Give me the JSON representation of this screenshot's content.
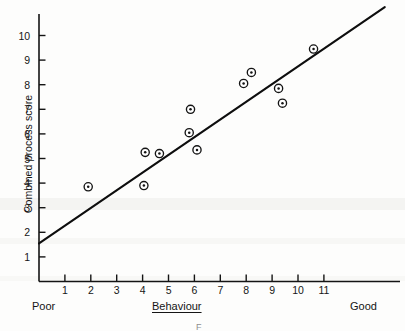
{
  "figure": {
    "name": "scatter-with-regression-line"
  },
  "chart_data": {
    "type": "scatter",
    "title": "",
    "xlabel": "Behaviour",
    "ylabel": "Combined process score",
    "xlim": [
      0,
      13.7
    ],
    "ylim": [
      0,
      11.3
    ],
    "grid": false,
    "legend": null,
    "x_tick_labels": [
      "1",
      "2",
      "3",
      "4",
      "5",
      "6",
      "7",
      "8",
      "9",
      "10",
      "11"
    ],
    "x_ticks": [
      1,
      2,
      3,
      4,
      5,
      6,
      7,
      8,
      9,
      10,
      11
    ],
    "y_tick_labels": [
      "1",
      "2",
      "3",
      "4",
      "5",
      "6",
      "7",
      "8",
      "9",
      "10"
    ],
    "y_ticks": [
      1,
      2,
      3,
      4,
      5,
      6,
      7,
      8,
      9,
      10
    ],
    "x_axis_low_anchor": "Poor",
    "x_axis_high_anchor": "Good",
    "points": [
      {
        "x": 1.9,
        "y": 3.85
      },
      {
        "x": 4.05,
        "y": 3.9
      },
      {
        "x": 4.1,
        "y": 5.25
      },
      {
        "x": 4.65,
        "y": 5.2
      },
      {
        "x": 5.8,
        "y": 6.05
      },
      {
        "x": 5.85,
        "y": 7.0
      },
      {
        "x": 6.1,
        "y": 5.35
      },
      {
        "x": 7.9,
        "y": 8.05
      },
      {
        "x": 8.2,
        "y": 8.5
      },
      {
        "x": 9.25,
        "y": 7.85
      },
      {
        "x": 9.4,
        "y": 7.25
      },
      {
        "x": 10.6,
        "y": 9.45
      }
    ],
    "marker_style": "circle-with-center-dot",
    "fit_line": {
      "type": "linear-regression",
      "x_start": 0.0,
      "y_start": 1.55,
      "x_end": 13.35,
      "y_end": 11.15,
      "slope": 0.72,
      "intercept": 1.55
    },
    "colors": {
      "ink": "#141414",
      "paper": "#fdfdfc",
      "marker_fill": "#ffffff"
    }
  },
  "caption": {
    "mark": "F"
  }
}
